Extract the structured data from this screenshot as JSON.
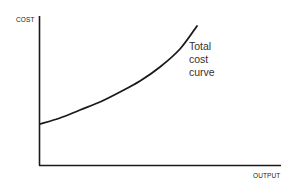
{
  "chart_data": {
    "type": "line",
    "title": "",
    "xlabel": "OUTPUT",
    "ylabel": "COST",
    "grid": false,
    "legend": null,
    "xlim": [
      0,
      240
    ],
    "ylim": [
      0,
      150
    ],
    "series": [
      {
        "name": "Total cost curve",
        "x": [
          0,
          20,
          40,
          60,
          80,
          100,
          120,
          140,
          157
        ],
        "y": [
          41,
          47,
          55,
          63,
          73,
          84,
          98,
          116,
          139
        ]
      }
    ],
    "annotations": [
      {
        "text": [
          "Total",
          "cost",
          "curve"
        ],
        "near": "end of curve"
      }
    ],
    "colors": {
      "curve": "#1a1a1a",
      "axis": "#1a1a1a",
      "text": "#333333"
    }
  },
  "labels": {
    "y_axis": "COST",
    "x_axis": "OUTPUT",
    "curve_label_line1": "Total",
    "curve_label_line2": "cost",
    "curve_label_line3": "curve"
  }
}
